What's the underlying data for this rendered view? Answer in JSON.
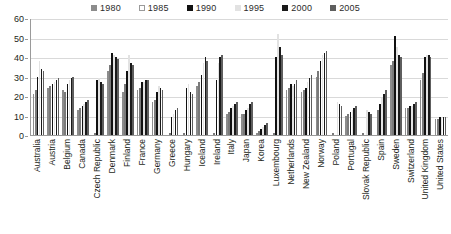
{
  "chart_data": {
    "type": "bar",
    "title": "",
    "subtitle": "",
    "xlabel": "",
    "ylabel": "",
    "ylim": [
      0,
      60
    ],
    "yticks": [
      0,
      10,
      20,
      30,
      40,
      50,
      60
    ],
    "grid": true,
    "legend_position": "top-center",
    "categories": [
      "Australia",
      "Austria",
      "Belgium",
      "Canada",
      "Czech Republic",
      "Denmark",
      "Finland",
      "France",
      "Germany",
      "Greece",
      "Hungary",
      "Iceland",
      "Ireland",
      "Italy",
      "Japan",
      "Korea",
      "Luxembourg",
      "Netherlands",
      "New Zealand",
      "Norway",
      "Poland",
      "Portugal",
      "Slovak Republic",
      "Spain",
      "Sweden",
      "Switzerland",
      "United Kingdom",
      "United States"
    ],
    "series": [
      {
        "name": "1980",
        "color": "#8c8c8c",
        "values": [
          21,
          24,
          23,
          13,
          0,
          33,
          22,
          23,
          17,
          0,
          0,
          25,
          0,
          11,
          11,
          1,
          0,
          23,
          22,
          30,
          0,
          10,
          0,
          0,
          36,
          14,
          28,
          8
        ]
      },
      {
        "name": "1985",
        "color": "#ffffff",
        "values": [
          23,
          25,
          22,
          14,
          0,
          36,
          26,
          24,
          18,
          0,
          0,
          27,
          0,
          12,
          11,
          2,
          0,
          24,
          23,
          33,
          0,
          11,
          0,
          13,
          38,
          14,
          32,
          8
        ]
      },
      {
        "name": "1990",
        "color": "#111111",
        "values": [
          30,
          26,
          26,
          15,
          28,
          42,
          33,
          27,
          22,
          9,
          24,
          31,
          28,
          14,
          13,
          3,
          40,
          26,
          24,
          38,
          0,
          12,
          0,
          16,
          51,
          15,
          40,
          9
        ]
      },
      {
        "name": "1995",
        "color": "#e2e2e2",
        "values": [
          38,
          27,
          28,
          16,
          29,
          41,
          41,
          27,
          25,
          11,
          26,
          37,
          37,
          15,
          14,
          4,
          52,
          25,
          27,
          41,
          17,
          13,
          13,
          19,
          45,
          15,
          41,
          9
        ]
      },
      {
        "name": "2000",
        "color": "#1a1a1a",
        "values": [
          34,
          28,
          29,
          17,
          27,
          40,
          37,
          28,
          24,
          13,
          22,
          40,
          40,
          16,
          16,
          5,
          45,
          26,
          29,
          42,
          16,
          14,
          12,
          21,
          41,
          16,
          41,
          9
        ]
      },
      {
        "name": "2005",
        "color": "#5e5e5e",
        "values": [
          33,
          29,
          30,
          18,
          26,
          39,
          36,
          28,
          23,
          14,
          21,
          38,
          41,
          17,
          17,
          6,
          41,
          28,
          31,
          43,
          15,
          15,
          11,
          23,
          40,
          17,
          40,
          9
        ]
      }
    ]
  }
}
